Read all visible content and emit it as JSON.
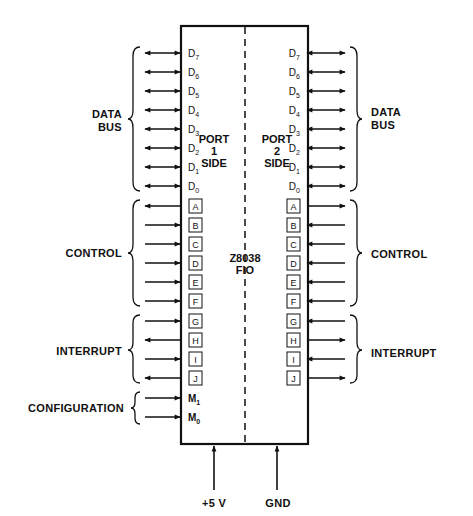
{
  "chip": {
    "name": "Z8038",
    "subname": "FIO",
    "port1_label": [
      "PORT",
      "1",
      "SIDE"
    ],
    "port2_label": [
      "PORT",
      "2",
      "SIDE"
    ]
  },
  "groups": {
    "left": [
      {
        "label": [
          "DATA",
          "BUS"
        ],
        "pins": [
          "D7",
          "D6",
          "D5",
          "D4",
          "D3",
          "D2",
          "D1",
          "D0"
        ]
      },
      {
        "label": [
          "CONTROL"
        ],
        "pins": [
          "A",
          "B",
          "C",
          "D",
          "E",
          "F"
        ]
      },
      {
        "label": [
          "INTERRUPT"
        ],
        "pins": [
          "G",
          "H",
          "I",
          "J"
        ]
      },
      {
        "label": [
          "CONFIGURATION"
        ],
        "pins": [
          "M1",
          "M0"
        ]
      }
    ],
    "right": [
      {
        "label": [
          "DATA",
          "BUS"
        ],
        "pins": [
          "D7",
          "D6",
          "D5",
          "D4",
          "D3",
          "D2",
          "D1",
          "D0"
        ]
      },
      {
        "label": [
          "CONTROL"
        ],
        "pins": [
          "A",
          "B",
          "C",
          "D",
          "E",
          "F"
        ]
      },
      {
        "label": [
          "INTERRUPT"
        ],
        "pins": [
          "G",
          "H",
          "I",
          "J"
        ]
      }
    ]
  },
  "left_pins": [
    {
      "id": "D",
      "sub": "7",
      "dir": "both",
      "boxed": false
    },
    {
      "id": "D",
      "sub": "6",
      "dir": "both",
      "boxed": false
    },
    {
      "id": "D",
      "sub": "5",
      "dir": "both",
      "boxed": false
    },
    {
      "id": "D",
      "sub": "4",
      "dir": "both",
      "boxed": false
    },
    {
      "id": "D",
      "sub": "3",
      "dir": "both",
      "boxed": false
    },
    {
      "id": "D",
      "sub": "2",
      "dir": "both",
      "boxed": false
    },
    {
      "id": "D",
      "sub": "1",
      "dir": "both",
      "boxed": false
    },
    {
      "id": "D",
      "sub": "0",
      "dir": "both",
      "boxed": false
    },
    {
      "id": "A",
      "sub": "",
      "dir": "out",
      "boxed": true
    },
    {
      "id": "B",
      "sub": "",
      "dir": "in",
      "boxed": true
    },
    {
      "id": "C",
      "sub": "",
      "dir": "in",
      "boxed": true
    },
    {
      "id": "D",
      "sub": "",
      "dir": "in",
      "boxed": true
    },
    {
      "id": "E",
      "sub": "",
      "dir": "in",
      "boxed": true
    },
    {
      "id": "F",
      "sub": "",
      "dir": "in",
      "boxed": true
    },
    {
      "id": "G",
      "sub": "",
      "dir": "in",
      "boxed": true
    },
    {
      "id": "H",
      "sub": "",
      "dir": "out",
      "boxed": true
    },
    {
      "id": "I",
      "sub": "",
      "dir": "in",
      "boxed": true
    },
    {
      "id": "J",
      "sub": "",
      "dir": "out",
      "boxed": true
    },
    {
      "id": "M",
      "sub": "1",
      "dir": "in",
      "boxed": false
    },
    {
      "id": "M",
      "sub": "0",
      "dir": "in",
      "boxed": false
    }
  ],
  "right_pins": [
    {
      "id": "D",
      "sub": "7",
      "dir": "both",
      "boxed": false
    },
    {
      "id": "D",
      "sub": "6",
      "dir": "both",
      "boxed": false
    },
    {
      "id": "D",
      "sub": "5",
      "dir": "both",
      "boxed": false
    },
    {
      "id": "D",
      "sub": "4",
      "dir": "both",
      "boxed": false
    },
    {
      "id": "D",
      "sub": "3",
      "dir": "both",
      "boxed": false
    },
    {
      "id": "D",
      "sub": "2",
      "dir": "both",
      "boxed": false
    },
    {
      "id": "D",
      "sub": "1",
      "dir": "both",
      "boxed": false
    },
    {
      "id": "D",
      "sub": "0",
      "dir": "both",
      "boxed": false
    },
    {
      "id": "A",
      "sub": "",
      "dir": "out",
      "boxed": true
    },
    {
      "id": "B",
      "sub": "",
      "dir": "in",
      "boxed": true
    },
    {
      "id": "C",
      "sub": "",
      "dir": "in",
      "boxed": true
    },
    {
      "id": "D",
      "sub": "",
      "dir": "in",
      "boxed": true
    },
    {
      "id": "E",
      "sub": "",
      "dir": "in",
      "boxed": true
    },
    {
      "id": "F",
      "sub": "",
      "dir": "in",
      "boxed": true
    },
    {
      "id": "G",
      "sub": "",
      "dir": "in",
      "boxed": true
    },
    {
      "id": "H",
      "sub": "",
      "dir": "out",
      "boxed": true
    },
    {
      "id": "I",
      "sub": "",
      "dir": "in",
      "boxed": true
    },
    {
      "id": "J",
      "sub": "",
      "dir": "out",
      "boxed": true
    }
  ],
  "power": {
    "vcc_label": "+5 V",
    "gnd_label": "GND"
  },
  "colors": {
    "line": "#111111",
    "background": "#ffffff"
  }
}
